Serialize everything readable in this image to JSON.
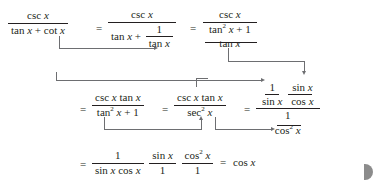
{
  "figure": {
    "kind": "math-derivation",
    "colors": {
      "ink": "#231f20",
      "connector": "#6d6e71",
      "page_marker": "#8c8c8c",
      "background": "#ffffff"
    }
  },
  "glyphs": {
    "equals": "=",
    "plus": "+",
    "one": "1",
    "var": "x",
    "csc": "csc",
    "sec": "sec",
    "sin": "sin",
    "cos": "cos",
    "tan": "tan",
    "cot": "cot",
    "exp2": "2"
  },
  "line1": {
    "expr1": {
      "numerator": "csc x",
      "denominator": "tan x + cot x"
    },
    "eq1": "=",
    "expr2": {
      "numerator": "csc x",
      "denominator_left": "tan x +",
      "denominator_frac": {
        "numerator": "1",
        "denominator": "tan x"
      }
    },
    "eq2": "=",
    "expr3": {
      "numerator": "csc x",
      "denominator_frac": {
        "numerator": "tan² x + 1",
        "denominator": "tan x"
      }
    },
    "substitution_note": "cot x  →  1 / tan x"
  },
  "line2": {
    "eq0": "=",
    "expr1": {
      "numerator": "csc x tan x",
      "denominator": "tan² x + 1"
    },
    "eq1": "=",
    "expr2": {
      "numerator": "csc x tan x",
      "denominator": "sec² x"
    },
    "eq2": "=",
    "expr3": {
      "numerator_frac_a": {
        "numerator": "1",
        "denominator": "sin x"
      },
      "numerator_frac_b": {
        "numerator": "sin x",
        "denominator": "cos x"
      },
      "denominator_frac": {
        "numerator": "1",
        "denominator": "cos² x"
      }
    },
    "substitution_note_1": "tan² x + 1  →  sec² x",
    "substitution_note_2": "sec² x  →  1 / cos² x",
    "substitution_note_3": "csc x  →  1 / sin x,   tan x  →  sin x / cos x"
  },
  "line3": {
    "eq0": "=",
    "frac_a": {
      "numerator": "1",
      "denominator": "sin x cos x"
    },
    "frac_b": {
      "numerator": "sin x",
      "denominator": "1"
    },
    "frac_c": {
      "numerator": "cos² x",
      "denominator": "1"
    },
    "eq1": "=",
    "result": "cos x"
  },
  "page_marker": {
    "label": "next-page-marker"
  }
}
